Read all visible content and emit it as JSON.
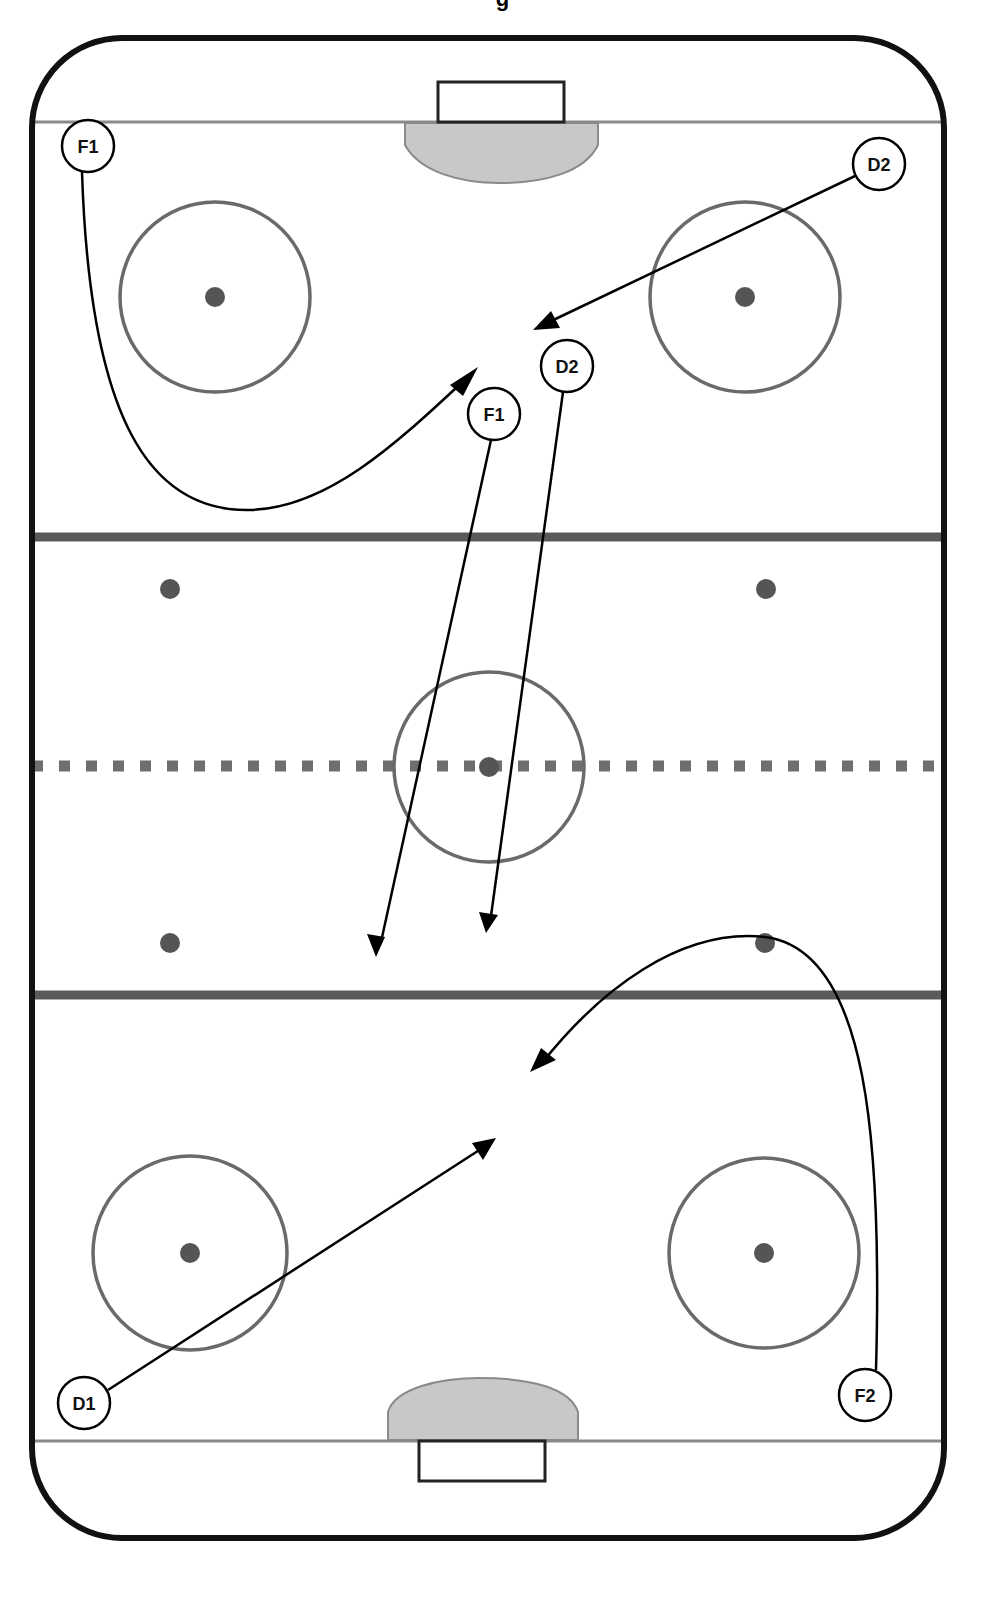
{
  "title_fragment": "g",
  "colors": {
    "boards": "#111111",
    "goal_line": "#8a8a8a",
    "blue_line": "#5a5a5a",
    "red_line": "#6e6e6e",
    "circle": "#6a6a6a",
    "dot": "#555555",
    "crease_fill": "#c8c8c8",
    "crease_stroke": "#8a8a8a",
    "path": "#000000",
    "player_fill": "#ffffff",
    "player_stroke": "#000000"
  },
  "rink": {
    "outline": {
      "x": 32,
      "y": 38,
      "width": 912,
      "height": 1500,
      "corner_radius": 90
    },
    "goal_lines": [
      {
        "y": 122
      },
      {
        "y": 1441
      }
    ],
    "blue_lines": [
      {
        "y": 537
      },
      {
        "y": 995
      }
    ],
    "red_line": {
      "y": 766
    },
    "nets": [
      {
        "name": "top-net",
        "x": 438,
        "y": 82,
        "width": 126,
        "height": 40
      },
      {
        "name": "bottom-net",
        "x": 419,
        "y": 1441,
        "width": 126,
        "height": 40
      }
    ],
    "creases": [
      {
        "name": "top-crease",
        "position": "top"
      },
      {
        "name": "bottom-crease",
        "position": "bottom"
      }
    ],
    "faceoff_circles": [
      {
        "name": "top-left-circle",
        "cx": 215,
        "cy": 297,
        "r": 95
      },
      {
        "name": "top-right-circle",
        "cx": 745,
        "cy": 297,
        "r": 95
      },
      {
        "name": "center-circle",
        "cx": 489,
        "cy": 767,
        "r": 95
      },
      {
        "name": "bottom-left-circle",
        "cx": 190,
        "cy": 1253,
        "r": 97
      },
      {
        "name": "bottom-right-circle",
        "cx": 764,
        "cy": 1253,
        "r": 95
      }
    ],
    "faceoff_dots": [
      {
        "cx": 215,
        "cy": 297
      },
      {
        "cx": 745,
        "cy": 297
      },
      {
        "cx": 170,
        "cy": 589
      },
      {
        "cx": 766,
        "cy": 589
      },
      {
        "cx": 489,
        "cy": 767
      },
      {
        "cx": 170,
        "cy": 943
      },
      {
        "cx": 765,
        "cy": 943
      },
      {
        "cx": 190,
        "cy": 1253
      },
      {
        "cx": 764,
        "cy": 1253
      }
    ]
  },
  "players": [
    {
      "label": "F1",
      "cx": 88,
      "cy": 146,
      "note": "start"
    },
    {
      "label": "D2",
      "cx": 879,
      "cy": 164,
      "note": "start"
    },
    {
      "label": "D2",
      "cx": 567,
      "cy": 366,
      "note": "position"
    },
    {
      "label": "F1",
      "cx": 494,
      "cy": 414,
      "note": "position"
    },
    {
      "label": "D1",
      "cx": 84,
      "cy": 1403,
      "note": "start"
    },
    {
      "label": "F2",
      "cx": 865,
      "cy": 1395,
      "note": "start"
    }
  ],
  "paths": [
    {
      "name": "f1-curve-path",
      "d": "M 82 172 C 90 420, 150 512, 250 510 C 330 508, 400 440, 470 375"
    },
    {
      "name": "d2-diagonal-path",
      "d": "M 855 176 L 545 324"
    },
    {
      "name": "f1-straight-path",
      "d": "M 491 440 L 381 942"
    },
    {
      "name": "d2-straight-path",
      "d": "M 563 392 L 491 916"
    },
    {
      "name": "f2-curve-path",
      "d": "M 876 1370 C 882 1150, 870 950, 765 937 C 680 928, 600 990, 542 1063"
    },
    {
      "name": "d1-diagonal-path",
      "d": "M 108 1390 L 484 1147"
    }
  ],
  "arrowheads": [
    {
      "name": "f1-curve-arrowhead",
      "points": "478,367 450,385 463,396"
    },
    {
      "name": "d2-diagonal-arrowhead",
      "points": "533,330 551,311 560,328"
    },
    {
      "name": "f1-straight-arrowhead",
      "points": "376,957 367,934 385,937"
    },
    {
      "name": "d2-straight-arrowhead",
      "points": "486,933 479,912 498,915"
    },
    {
      "name": "f2-curve-arrowhead",
      "points": "530,1072 541,1048 556,1060"
    },
    {
      "name": "d1-diagonal-arrowhead",
      "points": "496,1138 472,1143 483,1160"
    }
  ]
}
